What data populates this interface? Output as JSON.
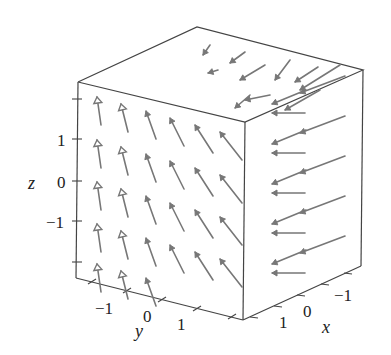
{
  "chart_data": {
    "type": "vector_field_3d",
    "title": "",
    "axes": {
      "x": {
        "label": "x",
        "ticks": [
          "1",
          "0",
          "−1"
        ],
        "range": [
          -2,
          2
        ]
      },
      "y": {
        "label": "y",
        "ticks": [
          "−1",
          "0",
          "1"
        ],
        "range": [
          -2,
          2
        ]
      },
      "z": {
        "label": "z",
        "ticks": [
          "1",
          "0",
          "−1"
        ],
        "range": [
          -2,
          2
        ]
      }
    },
    "grid": false,
    "box": true,
    "arrow_color": "#777777",
    "box_color": "#444444"
  },
  "labels": {
    "x_axis": "x",
    "y_axis": "y",
    "z_axis": "z",
    "z_ticks": [
      "1",
      "0",
      "−1"
    ],
    "y_ticks": [
      "−1",
      "0",
      "1"
    ],
    "x_ticks": [
      "1",
      "0",
      "−1"
    ]
  }
}
